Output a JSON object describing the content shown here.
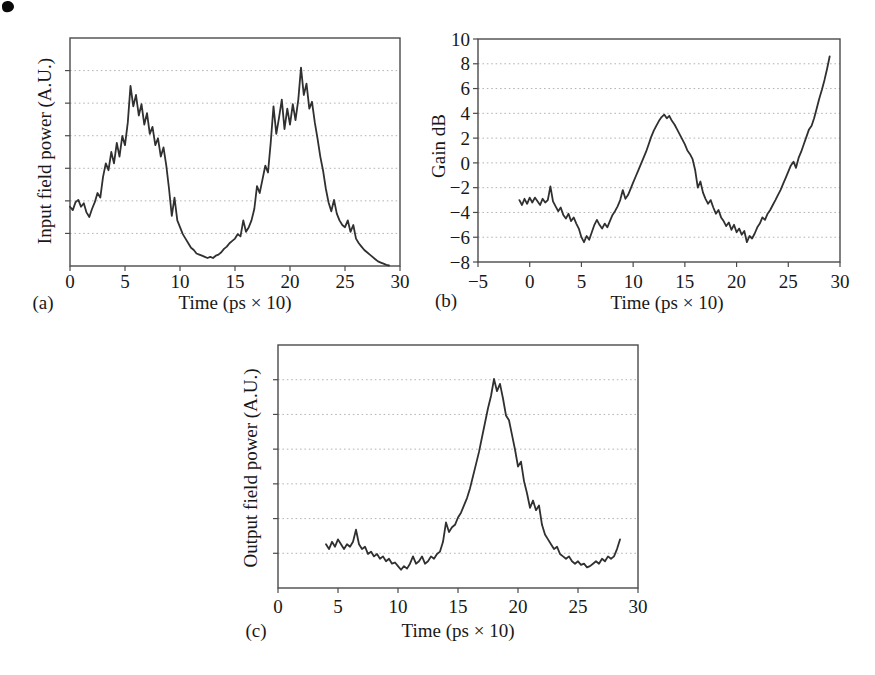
{
  "figure": {
    "background": "#ffffff",
    "panel_labels": [
      "(a)",
      "(b)",
      "(c)"
    ]
  },
  "colors": {
    "curve": "#303030",
    "frame": "#4a4a4a",
    "grid": "#adadad",
    "text": "#181818",
    "scan_mark": "#0a0a0a"
  },
  "chart_data": [
    {
      "type": "line",
      "panel_label": "(a)",
      "xlabel": "Time (ps × 10)",
      "ylabel": "Input field power (A.U.)",
      "xlim": [
        0,
        30
      ],
      "ylim": [
        0,
        10
      ],
      "xticks": [
        0,
        5,
        10,
        15,
        20,
        25,
        30
      ],
      "grid_divisions": 7,
      "grid_style": "dotted",
      "x0": 0,
      "dx": 0.25,
      "y": [
        2.6,
        2.45,
        2.8,
        2.9,
        2.6,
        2.75,
        2.35,
        2.15,
        2.5,
        2.8,
        3.2,
        3.0,
        3.9,
        4.5,
        4.2,
        5.0,
        4.5,
        5.4,
        4.8,
        5.7,
        5.3,
        6.3,
        7.9,
        7.0,
        7.5,
        6.6,
        7.1,
        6.2,
        6.7,
        5.8,
        6.1,
        5.3,
        5.6,
        4.8,
        5.2,
        4.4,
        3.4,
        2.2,
        3.0,
        2.0,
        1.7,
        1.4,
        1.2,
        1.0,
        0.8,
        0.7,
        0.55,
        0.5,
        0.45,
        0.4,
        0.35,
        0.4,
        0.35,
        0.45,
        0.5,
        0.6,
        0.75,
        0.85,
        1.0,
        1.1,
        1.2,
        1.4,
        1.3,
        2.0,
        1.5,
        1.7,
        2.0,
        2.5,
        3.5,
        3.2,
        3.8,
        4.4,
        4.1,
        5.4,
        7.0,
        5.8,
        6.5,
        7.3,
        6.0,
        6.9,
        6.2,
        7.1,
        6.4,
        7.3,
        8.7,
        7.5,
        8.0,
        6.9,
        7.2,
        6.3,
        5.6,
        4.8,
        4.2,
        3.4,
        2.8,
        2.4,
        2.9,
        2.3,
        2.0,
        1.8,
        1.7,
        2.0,
        1.5,
        1.8,
        1.2,
        1.0,
        0.85,
        0.7,
        0.6,
        0.5,
        0.4,
        0.3,
        0.2,
        0.15,
        0.1,
        0.05,
        0.02
      ]
    },
    {
      "type": "line",
      "panel_label": "(b)",
      "xlabel": "Time (ps × 10)",
      "ylabel": "Gain dB",
      "xlim": [
        -5,
        30
      ],
      "ylim": [
        -8,
        10
      ],
      "xticks": [
        -5,
        0,
        5,
        10,
        15,
        20,
        25,
        30
      ],
      "yticks": [
        10,
        8,
        6,
        4,
        2,
        0,
        -2,
        -4,
        -6,
        -8
      ],
      "grid_style": "dotted",
      "x0": -1,
      "dx": 0.25,
      "y": [
        -3.0,
        -3.4,
        -2.9,
        -3.3,
        -2.8,
        -3.2,
        -2.8,
        -3.1,
        -3.4,
        -2.9,
        -3.2,
        -3.0,
        -1.9,
        -3.1,
        -3.5,
        -3.9,
        -3.6,
        -4.2,
        -4.5,
        -4.1,
        -4.7,
        -4.4,
        -4.9,
        -5.3,
        -6.0,
        -6.4,
        -5.9,
        -6.2,
        -5.6,
        -5.0,
        -4.6,
        -5.0,
        -5.3,
        -4.9,
        -5.2,
        -4.7,
        -4.2,
        -3.9,
        -3.5,
        -3.0,
        -2.2,
        -2.9,
        -2.6,
        -2.1,
        -1.6,
        -1.1,
        -0.6,
        -0.1,
        0.4,
        0.9,
        1.5,
        2.1,
        2.6,
        3.0,
        3.4,
        3.7,
        3.9,
        3.6,
        3.8,
        3.4,
        3.1,
        2.7,
        2.3,
        1.9,
        1.5,
        1.0,
        0.7,
        0.3,
        -0.6,
        -2.0,
        -1.5,
        -2.4,
        -2.9,
        -3.3,
        -3.0,
        -3.6,
        -4.1,
        -3.8,
        -4.4,
        -4.7,
        -5.1,
        -4.8,
        -5.4,
        -5.0,
        -5.6,
        -5.3,
        -5.8,
        -5.5,
        -6.4,
        -5.9,
        -6.1,
        -5.7,
        -5.2,
        -4.9,
        -4.4,
        -4.6,
        -4.1,
        -3.8,
        -3.4,
        -3.0,
        -2.6,
        -2.2,
        -1.7,
        -1.2,
        -0.7,
        -0.2,
        0.1,
        -0.4,
        0.4,
        0.9,
        1.5,
        2.1,
        2.7,
        3.0,
        3.6,
        4.4,
        5.2,
        5.9,
        6.7,
        7.6,
        8.6
      ]
    },
    {
      "type": "line",
      "panel_label": "(c)",
      "xlabel": "Time (ps × 10)",
      "ylabel": "Output field power (A.U.)",
      "xlim": [
        0,
        30
      ],
      "ylim": [
        0,
        10
      ],
      "xticks": [
        0,
        5,
        10,
        15,
        20,
        25,
        30
      ],
      "grid_divisions": 7,
      "grid_style": "dotted",
      "x0": 4,
      "dx": 0.25,
      "y": [
        1.8,
        1.6,
        1.9,
        1.7,
        2.0,
        1.8,
        1.6,
        1.8,
        1.7,
        1.9,
        2.4,
        1.8,
        1.6,
        1.7,
        1.4,
        1.5,
        1.3,
        1.4,
        1.2,
        1.3,
        1.1,
        1.2,
        1.0,
        1.05,
        0.9,
        0.75,
        0.9,
        0.8,
        1.0,
        1.3,
        1.0,
        1.1,
        1.3,
        1.0,
        1.1,
        1.3,
        1.2,
        1.4,
        1.5,
        1.9,
        2.7,
        2.3,
        2.5,
        2.6,
        2.9,
        3.1,
        3.4,
        3.7,
        4.1,
        4.6,
        5.1,
        5.6,
        6.2,
        6.8,
        7.4,
        7.9,
        8.6,
        8.1,
        8.4,
        7.8,
        7.1,
        6.9,
        6.3,
        5.7,
        5.0,
        5.2,
        4.4,
        3.9,
        3.3,
        3.6,
        3.2,
        3.4,
        2.6,
        2.2,
        2.0,
        1.8,
        1.6,
        1.7,
        1.4,
        1.3,
        1.2,
        1.3,
        1.1,
        1.0,
        1.1,
        0.95,
        1.0,
        0.85,
        0.9,
        1.0,
        1.1,
        1.0,
        1.2,
        1.1,
        1.3,
        1.2,
        1.3,
        1.6,
        2.0
      ]
    }
  ]
}
